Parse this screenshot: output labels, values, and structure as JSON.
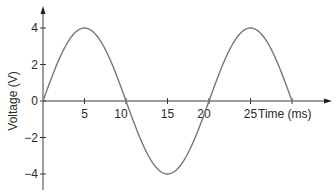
{
  "chart_data": {
    "type": "line",
    "title": "",
    "xlabel": "Time (ms)",
    "ylabel": "Voltage (V)",
    "xlim": [
      0,
      30
    ],
    "ylim": [
      -4,
      4
    ],
    "grid": false,
    "x_ticks": [
      5,
      10,
      15,
      20,
      25
    ],
    "x_tick_labels": [
      "5",
      "10",
      "15",
      "20",
      "25"
    ],
    "y_ticks": [
      4,
      2,
      0,
      -2,
      -4
    ],
    "y_tick_labels": [
      "4",
      "2",
      "0",
      "−2",
      "−4"
    ],
    "series": [
      {
        "name": "Voltage",
        "function": "4*sin(2*pi*t/20)",
        "amplitude": 4,
        "period_ms": 20,
        "x": [
          0,
          5,
          10,
          15,
          20,
          25,
          30
        ],
        "values": [
          0,
          4,
          0,
          -4,
          0,
          4,
          0
        ]
      }
    ]
  }
}
